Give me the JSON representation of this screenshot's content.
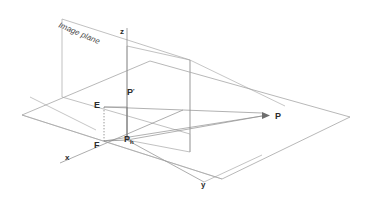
{
  "figure": {
    "title_caption": "Image plane",
    "background_color": "#ffffff",
    "line_color": "#8a8a8a",
    "ray_color": "#8f8f8f",
    "text_color": "#2b2b2b",
    "width": 373,
    "height": 205
  },
  "axes": [
    {
      "id": "x",
      "label": "x",
      "label_x": 65,
      "label_y": 160
    },
    {
      "id": "y",
      "label": "y",
      "label_x": 201,
      "label_y": 187
    },
    {
      "id": "z",
      "label": "z",
      "label_x": 120,
      "label_y": 34
    }
  ],
  "points": [
    {
      "id": "E",
      "label": "E",
      "sub": "",
      "label_x": 94,
      "label_y": 108
    },
    {
      "id": "Pprime",
      "label": "P",
      "sub": "′",
      "label_x": 127,
      "label_y": 95
    },
    {
      "id": "F",
      "label": "F",
      "sub": "",
      "label_x": 94,
      "label_y": 148
    },
    {
      "id": "Ph",
      "label": "P",
      "sub": "h",
      "label_x": 124,
      "label_y": 142
    },
    {
      "id": "P",
      "label": "P",
      "sub": "",
      "label_x": 265,
      "label_y": 119
    }
  ],
  "geometry": {
    "ground_plane": "22,115 150,61 350,117 222,179",
    "image_plane": "62,97 62,19 190,60 190,134",
    "vertical_plane": "127,140 127,46 190,60 190,152",
    "ground_diagonal_left": "22,115 222,179",
    "axis_x_line": "60,163 183,110",
    "axis_y_line": "127,140 204,182",
    "axis_y_extend": "204,182 262,155",
    "axis_z_line": "127,140 127,28",
    "ray_E_to_P": "104,107 262,113",
    "ray_F_to_P": "104,141 262,116",
    "ray_E_to_Pprime": "104,107 127,107",
    "ray_Ph_to_P": "127,140 262,116",
    "arrow_tip": "262,115",
    "seg_E_vertical_dotted": "104,107 104,141",
    "seg_F_to_Ph": "104,141 127,140",
    "seg_Pprime_to_Ph": "127,107 127,140",
    "plane_cross_line": "30,97 96,130",
    "right_cross_line": "190,60 285,106",
    "ground_far_edge": "150,61 350,117",
    "vertical_plane_right_edge": "190,60 190,152",
    "vertical_drop_y": "190,134 190,152"
  },
  "caption": {
    "text": "Image plane",
    "x": 58,
    "y": 27,
    "rotation": 23
  }
}
